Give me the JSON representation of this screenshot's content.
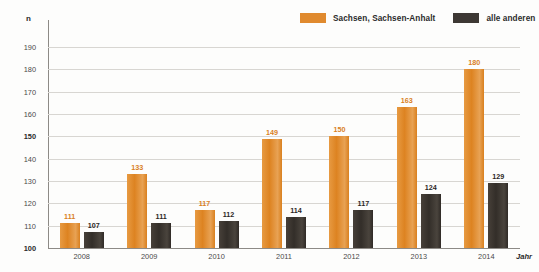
{
  "chart_data": {
    "type": "bar",
    "title": "",
    "xlabel": "Jahr",
    "ylabel": "n",
    "categories": [
      "2008",
      "2009",
      "2010",
      "2011",
      "2012",
      "2013",
      "2014"
    ],
    "series": [
      {
        "name": "Sachsen, Sachsen-Anhalt",
        "color": "#E08A2E",
        "values": [
          111,
          133,
          117,
          149,
          150,
          163,
          180
        ]
      },
      {
        "name": "alle anderen",
        "color": "#3D3834",
        "values": [
          107,
          111,
          112,
          114,
          117,
          124,
          129
        ]
      }
    ],
    "ylim": [
      100,
      195
    ],
    "ytick_values": [
      100,
      110,
      120,
      130,
      140,
      150,
      160,
      170,
      180,
      190
    ],
    "ytick_labels": [
      "100",
      "110",
      "120",
      "130",
      "140",
      "150",
      "160",
      "170",
      "180",
      "190"
    ],
    "grid": true,
    "legend_position": "top-right"
  },
  "legend": {
    "entries": [
      {
        "label": "Sachsen, Sachsen-Anhalt",
        "color": "#E08A2E"
      },
      {
        "label": "alle anderen",
        "color": "#3D3834"
      }
    ]
  }
}
